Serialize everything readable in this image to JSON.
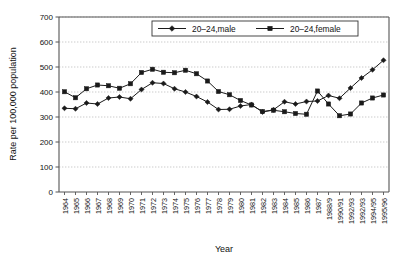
{
  "chart_data": {
    "type": "line",
    "title": "",
    "xlabel": "Year",
    "ylabel": "Rate per 100,000 population",
    "ylim": [
      0,
      700
    ],
    "ytick_step": 100,
    "yticks": [
      0,
      100,
      200,
      300,
      400,
      500,
      600,
      700
    ],
    "grid": true,
    "grid_axis": "y",
    "legend_position": "top-center",
    "categories": [
      "1964",
      "1965",
      "1966",
      "1967",
      "1968",
      "1969",
      "1970",
      "1971",
      "1972",
      "1973",
      "1974",
      "1975",
      "1976",
      "1977",
      "1978",
      "1979",
      "1980",
      "1981",
      "1982",
      "1983",
      "1984",
      "1985",
      "1986",
      "1987",
      "1988/9",
      "1990/91",
      "1992/93",
      "1992/93",
      "1994/95",
      "1995/96"
    ],
    "series": [
      {
        "name": "20–24,male",
        "marker": "diamond",
        "color": "#1a1a1a",
        "values": [
          335,
          333,
          356,
          352,
          376,
          380,
          373,
          410,
          437,
          434,
          413,
          400,
          382,
          360,
          330,
          331,
          344,
          350,
          320,
          329,
          361,
          352,
          362,
          364,
          386,
          375,
          416,
          456,
          489,
          527
        ]
      },
      {
        "name": "20–24,female",
        "marker": "square",
        "color": "#1a1a1a",
        "values": [
          401,
          377,
          413,
          428,
          425,
          415,
          433,
          478,
          491,
          479,
          477,
          487,
          473,
          444,
          402,
          389,
          366,
          348,
          322,
          327,
          321,
          314,
          311,
          404,
          352,
          305,
          312,
          356,
          376,
          388
        ]
      }
    ]
  },
  "legend": {
    "items": [
      {
        "label": "20–24,male"
      },
      {
        "label": "20–24,female"
      }
    ]
  }
}
